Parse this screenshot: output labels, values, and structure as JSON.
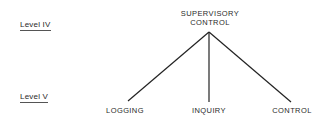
{
  "levels": [
    {
      "label": "Level IV"
    },
    {
      "label": "Level V"
    }
  ],
  "root": {
    "line1": "SUPERVISORY",
    "line2": "CONTROL"
  },
  "children": [
    {
      "label": "LOGGING"
    },
    {
      "label": "INQUIRY"
    },
    {
      "label": "CONTROL"
    }
  ]
}
